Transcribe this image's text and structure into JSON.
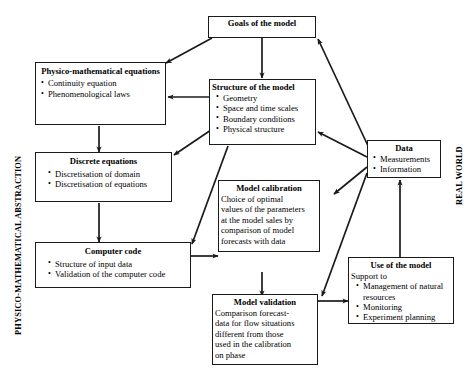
{
  "diagram": {
    "side_labels": {
      "left": "PHYSICO-MATHEMATICAL ABSTRACTION",
      "right": "REAL WORLD"
    },
    "colors": {
      "line": "#1a1a1a",
      "box_border": "#1a1a1a",
      "background": "#ffffff",
      "text": "#000000"
    },
    "nodes": {
      "goals": {
        "title": "Goals of the model",
        "items": []
      },
      "physico": {
        "title": "Physico-mathematical equations",
        "items": [
          "Continuity equation",
          "Phenomenological laws"
        ]
      },
      "structure": {
        "title": "Structure of the model",
        "items": [
          "Geometry",
          "Space and time scales",
          "Boundary conditions",
          "Physical structure"
        ]
      },
      "discrete": {
        "title": "Discrete equations",
        "items": [
          "Discretisation of domain",
          "Discretisation of equations"
        ]
      },
      "computer": {
        "title": "Computer code",
        "items": [
          "Structure of input data",
          "Validation of the computer code"
        ]
      },
      "calibration": {
        "title": "Model calibration",
        "lines": [
          "Choice of optimal",
          "values of the parameters",
          "at the model sales by",
          "comparison of model",
          "forecasts with data"
        ]
      },
      "validation": {
        "title": "Model validation",
        "lines": [
          "Comparison forecast-",
          "data for flow situations",
          "different from those",
          "used in the calibration",
          "on phase"
        ]
      },
      "data": {
        "title": "Data",
        "items": [
          "Measurements",
          "Information"
        ]
      },
      "use": {
        "title": "Use of the model",
        "intro": "Support to",
        "items": [
          "Management of natural resources",
          "Monitoring",
          "Experiment planning"
        ]
      }
    },
    "edges": [
      {
        "from": "goals",
        "to": "physico"
      },
      {
        "from": "goals",
        "to": "structure"
      },
      {
        "from": "structure",
        "to": "physico"
      },
      {
        "from": "structure",
        "to": "discrete"
      },
      {
        "from": "structure",
        "to": "computer"
      },
      {
        "from": "physico",
        "to": "discrete"
      },
      {
        "from": "discrete",
        "to": "computer"
      },
      {
        "from": "computer",
        "to": "calibration"
      },
      {
        "from": "calibration",
        "to": "validation"
      },
      {
        "from": "validation",
        "to": "use"
      },
      {
        "from": "use",
        "to": "data"
      },
      {
        "from": "data",
        "to": "goals"
      },
      {
        "from": "data",
        "to": "structure"
      },
      {
        "from": "data",
        "to": "calibration"
      },
      {
        "from": "data",
        "to": "validation"
      }
    ]
  }
}
